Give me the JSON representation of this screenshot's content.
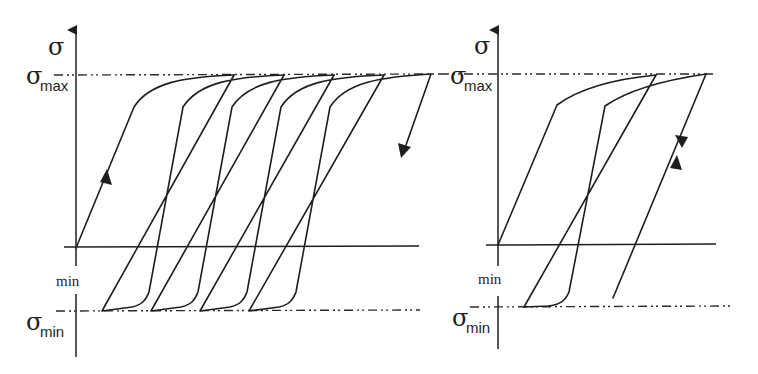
{
  "figure": {
    "stroke_color": "#1e1e1e",
    "background": "#ffffff"
  },
  "left_panel": {
    "axis_label_symbol": "σ",
    "max_label": {
      "symbol": "σ",
      "subscript": "max"
    },
    "min_label": {
      "symbol": "σ",
      "subscript": "min"
    },
    "axis_gap_label": "min",
    "cycles": 4,
    "loading_arrow": "up",
    "final_arrow": "down"
  },
  "right_panel": {
    "axis_label_symbol": "σ",
    "max_label": {
      "symbol": "σ",
      "subscript": "max"
    },
    "min_label": {
      "symbol": "σ",
      "subscript": "min"
    },
    "axis_gap_label": "min",
    "cycles": 2,
    "elastic_arrows": [
      "up",
      "down"
    ]
  }
}
